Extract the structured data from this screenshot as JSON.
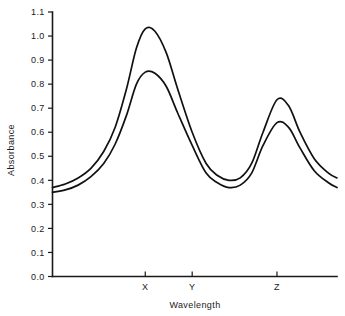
{
  "chart_data": {
    "type": "line",
    "title": "",
    "xlabel": "Wavelength",
    "ylabel": "Absorbance",
    "grid": false,
    "legend": "none",
    "xlim": [
      0,
      10
    ],
    "ylim": [
      0.0,
      1.1
    ],
    "y_ticks": [
      "0.0",
      "0.1",
      "0.2",
      "0.3",
      "0.4",
      "0.5",
      "0.6",
      "0.7",
      "0.8",
      "0.9",
      "1.0",
      "1.1"
    ],
    "y_tick_values": [
      0.0,
      0.1,
      0.2,
      0.3,
      0.4,
      0.5,
      0.6,
      0.7,
      0.8,
      0.9,
      1.0,
      1.1
    ],
    "x_ticks": [
      "X",
      "Y",
      "Z"
    ],
    "x_tick_values": [
      3.26,
      4.91,
      7.89
    ],
    "series": [
      {
        "name": "upper",
        "x": [
          0.0,
          0.45,
          0.9,
          1.35,
          1.8,
          2.2,
          2.6,
          2.95,
          3.26,
          3.6,
          4.0,
          4.4,
          4.91,
          5.4,
          5.8,
          6.2,
          6.6,
          7.0,
          7.4,
          7.89,
          8.3,
          8.7,
          9.2,
          9.7,
          10.0
        ],
        "values": [
          0.37,
          0.385,
          0.41,
          0.45,
          0.52,
          0.62,
          0.78,
          0.95,
          1.03,
          1.02,
          0.93,
          0.78,
          0.6,
          0.47,
          0.42,
          0.4,
          0.41,
          0.47,
          0.6,
          0.735,
          0.71,
          0.6,
          0.49,
          0.43,
          0.41
        ]
      },
      {
        "name": "lower",
        "x": [
          0.0,
          0.45,
          0.9,
          1.35,
          1.8,
          2.2,
          2.6,
          2.95,
          3.26,
          3.6,
          4.0,
          4.4,
          4.91,
          5.4,
          5.8,
          6.2,
          6.6,
          7.0,
          7.4,
          7.89,
          8.3,
          8.7,
          9.2,
          9.7,
          10.0
        ],
        "values": [
          0.35,
          0.36,
          0.38,
          0.415,
          0.47,
          0.55,
          0.67,
          0.8,
          0.85,
          0.845,
          0.79,
          0.68,
          0.545,
          0.43,
          0.39,
          0.37,
          0.38,
          0.43,
          0.545,
          0.64,
          0.62,
          0.535,
          0.44,
          0.39,
          0.37
        ]
      }
    ],
    "annotations": {
      "peak_x_upper": 1.03,
      "peak_x_lower": 0.85,
      "peak_z_upper": 0.735,
      "peak_z_lower": 0.64,
      "valley_upper": 0.4,
      "valley_lower": 0.37
    },
    "colors": {
      "curve": "#111111",
      "axis": "#1a1a1a",
      "background": "#ffffff"
    }
  }
}
